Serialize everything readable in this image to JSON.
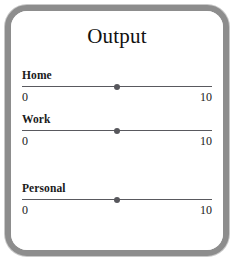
{
  "panel": {
    "title": "Output",
    "frame_color": "#8d8d8d",
    "background_color": "#ffffff"
  },
  "sliders": [
    {
      "label": "Home",
      "min_label": "0",
      "max_label": "10",
      "thumb_percent": 50,
      "track_color": "#59595e",
      "thumb_color": "#57575c"
    },
    {
      "label": "Work",
      "min_label": "0",
      "max_label": "10",
      "thumb_percent": 50,
      "track_color": "#59595e",
      "thumb_color": "#57575c"
    },
    {
      "label": "Personal",
      "min_label": "0",
      "max_label": "10",
      "thumb_percent": 50,
      "track_color": "#59595e",
      "thumb_color": "#57575c"
    }
  ]
}
